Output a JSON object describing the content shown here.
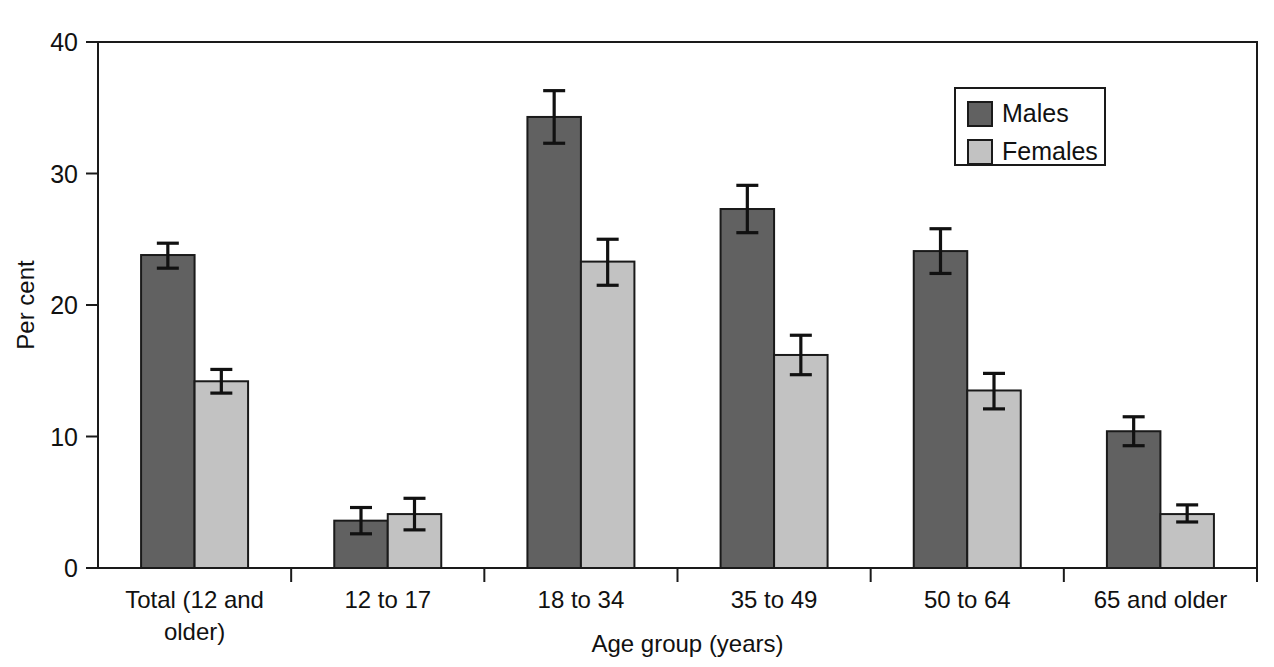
{
  "chart_data": {
    "type": "bar",
    "title": "",
    "subtitle": "",
    "xlabel": "Age group (years)",
    "ylabel": "Per cent",
    "ylim": [
      0,
      40
    ],
    "yticks": [
      0,
      10,
      20,
      30,
      40
    ],
    "ytick_labels": [
      "0",
      "10",
      "20",
      "30",
      "40"
    ],
    "grid": false,
    "legend_position": "top-right",
    "categories": [
      "Total (12 and older)",
      "12 to 17",
      "18 to 34",
      "35 to 49",
      "50 to 64",
      "65 and older"
    ],
    "category_lines": [
      [
        "Total (12 and",
        "older)"
      ],
      [
        "12 to 17"
      ],
      [
        "18 to 34"
      ],
      [
        "35 to 49"
      ],
      [
        "50 to 64"
      ],
      [
        "65 and older"
      ]
    ],
    "series": [
      {
        "name": "Males",
        "color": "#616161",
        "values": [
          23.8,
          3.6,
          34.3,
          27.3,
          24.1,
          10.4
        ],
        "error_low": [
          22.8,
          2.6,
          32.3,
          25.5,
          22.4,
          9.3
        ],
        "error_high": [
          24.7,
          4.6,
          36.3,
          29.1,
          25.8,
          11.5
        ]
      },
      {
        "name": "Females",
        "color": "#c2c2c2",
        "values": [
          14.2,
          4.1,
          23.3,
          16.2,
          13.5,
          4.1
        ],
        "error_low": [
          13.3,
          2.9,
          21.5,
          14.7,
          12.1,
          3.5
        ],
        "error_high": [
          15.1,
          5.3,
          25.0,
          17.7,
          14.8,
          4.8
        ]
      }
    ]
  },
  "legend": {
    "entries": [
      {
        "label": "Males",
        "color": "#616161"
      },
      {
        "label": "Females",
        "color": "#c2c2c2"
      }
    ]
  },
  "colors": {
    "males": "#616161",
    "females": "#c2c2c2",
    "axis": "#1a1a1a",
    "text": "#111111",
    "background": "#ffffff"
  }
}
